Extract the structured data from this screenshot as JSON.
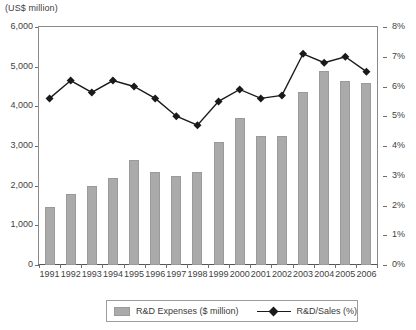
{
  "axis": {
    "unit_caption": "(US$ million)",
    "left_ticks": [
      "6,000",
      "5,000",
      "4,000",
      "3,000",
      "2,000",
      "1,000",
      "0"
    ],
    "right_ticks": [
      "8%",
      "7%",
      "6%",
      "5%",
      "4%",
      "3%",
      "2%",
      "1%",
      "0%"
    ]
  },
  "legend": {
    "bars_label": "R&D Expenses ($ million)",
    "line_label": "R&D/Sales (%)"
  },
  "colors": {
    "bar_fill": "#aaaaaa",
    "bar_border": "#9a9a9a",
    "line": "#1a1a1a",
    "axis": "#8a8a8a",
    "text": "#3f3f3f"
  },
  "chart_data": {
    "type": "bar",
    "title": "",
    "subtitle": "",
    "xlabel": "",
    "ylabel": "(US$ million)",
    "y2label": "",
    "grid": false,
    "legend_position": "bottom",
    "ylim": [
      0,
      6000
    ],
    "y2lim": [
      0,
      8
    ],
    "yticks": [
      0,
      1000,
      2000,
      3000,
      4000,
      5000,
      6000
    ],
    "y2ticks": [
      0,
      1,
      2,
      3,
      4,
      5,
      6,
      7,
      8
    ],
    "categories": [
      "1991",
      "1992",
      "1993",
      "1994",
      "1995",
      "1996",
      "1997",
      "1998",
      "1999",
      "2000",
      "2001",
      "2002",
      "2003",
      "2004",
      "2005",
      "2006"
    ],
    "series": [
      {
        "name": "R&D Expenses ($ million)",
        "type": "bar",
        "axis": "left",
        "values": [
          1450,
          1800,
          2000,
          2200,
          2650,
          2350,
          2250,
          2350,
          3100,
          3700,
          3250,
          3250,
          4350,
          4900,
          4650,
          4600
        ]
      },
      {
        "name": "R&D/Sales (%)",
        "type": "line",
        "axis": "right",
        "marker": "diamond",
        "values": [
          5.6,
          6.2,
          5.8,
          6.2,
          6.0,
          5.6,
          5.0,
          4.7,
          5.5,
          5.9,
          5.6,
          5.7,
          7.1,
          6.8,
          7.0,
          6.5
        ]
      }
    ]
  }
}
